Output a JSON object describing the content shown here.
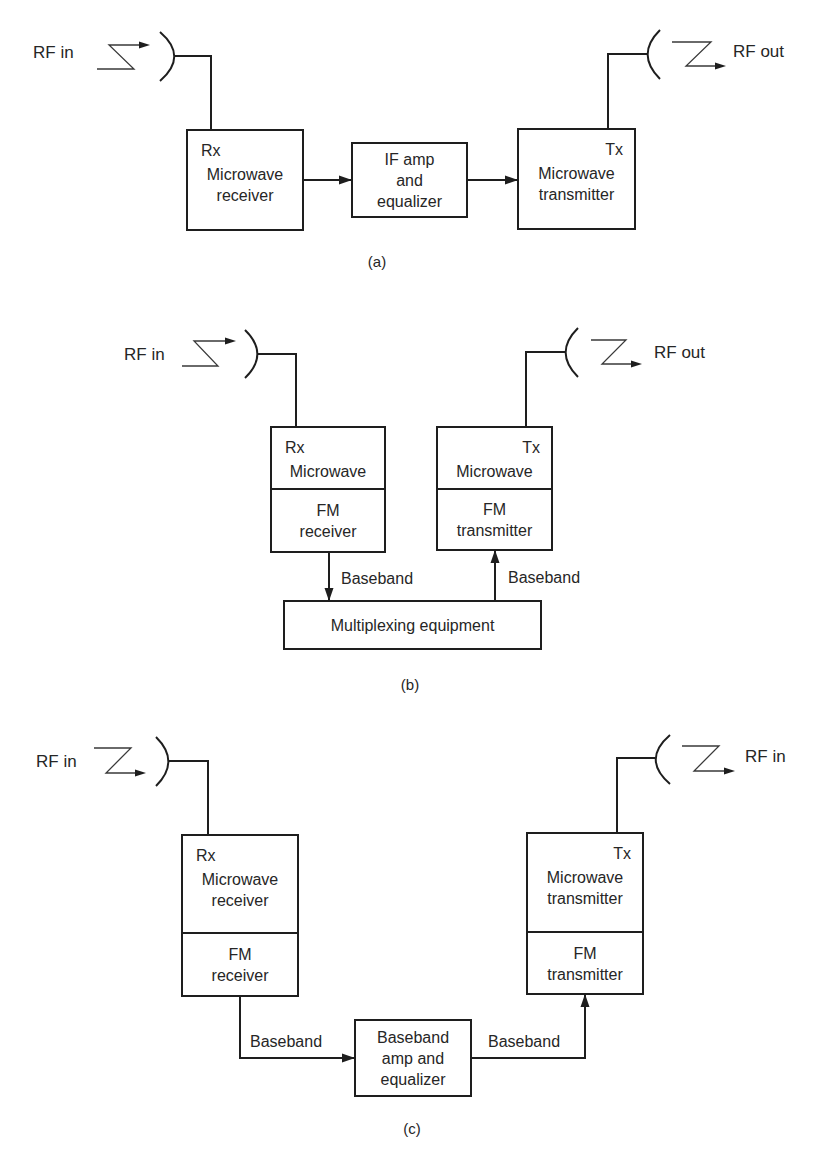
{
  "diagrams": [
    {
      "id": "a",
      "caption": "(a)",
      "caption_pos": [
        377,
        267
      ],
      "rf_left": {
        "label": "RF in",
        "label_pos": [
          33,
          58
        ],
        "zig": "rise",
        "zig_x": [
          97,
          109,
          134,
          150
        ],
        "zig_y": [
          45,
          69
        ],
        "arc": [
          160,
          32,
          175,
          81
        ],
        "feed": [
          [
            175,
            56
          ],
          [
            211,
            56
          ],
          [
            211,
            130
          ]
        ]
      },
      "rf_right": {
        "label": "RF out",
        "label_pos": [
          733,
          57
        ],
        "zig": "fall",
        "zig_x": [
          672,
          711,
          686,
          726
        ],
        "zig_y": [
          42,
          66
        ],
        "arc": [
          660,
          30,
          647,
          79
        ],
        "feed": [
          [
            608,
            129
          ],
          [
            608,
            54
          ],
          [
            647,
            54
          ]
        ]
      },
      "blocks": [
        {
          "name": "rx-microwave-receiver-block",
          "rect": [
            187,
            130,
            116,
            100
          ],
          "tag": "Rx",
          "tag_align": "left",
          "lines": [
            "Microwave",
            "receiver"
          ],
          "divider": null,
          "lower_lines": []
        },
        {
          "name": "if-amp-equalizer-block",
          "rect": [
            352,
            143,
            115,
            74
          ],
          "tag": "",
          "tag_align": "left",
          "lines": [
            "IF amp",
            "and",
            "equalizer"
          ],
          "divider": null,
          "lower_lines": []
        },
        {
          "name": "tx-microwave-transmitter-block",
          "rect": [
            518,
            129,
            117,
            100
          ],
          "tag": "Tx",
          "tag_align": "right",
          "lines": [
            "Microwave",
            "transmitter"
          ],
          "divider": null,
          "lower_lines": []
        }
      ],
      "connectors": [
        {
          "points": [
            [
              303,
              180
            ],
            [
              352,
              180
            ]
          ],
          "arrow": "end"
        },
        {
          "points": [
            [
              467,
              180
            ],
            [
              518,
              180
            ]
          ],
          "arrow": "end"
        }
      ],
      "labels": []
    },
    {
      "id": "b",
      "caption": "(b)",
      "caption_pos": [
        410,
        690
      ],
      "rf_left": {
        "label": "RF in",
        "label_pos": [
          124,
          360
        ],
        "zig": "rise",
        "zig_x": [
          182,
          194,
          218,
          236
        ],
        "zig_y": [
          341,
          366
        ],
        "arc": [
          245,
          330,
          258,
          378
        ],
        "feed": [
          [
            258,
            354
          ],
          [
            296,
            354
          ],
          [
            296,
            427
          ]
        ]
      },
      "rf_right": {
        "label": "RF out",
        "label_pos": [
          654,
          358
        ],
        "zig": "fall",
        "zig_x": [
          591,
          626,
          602,
          642
        ],
        "zig_y": [
          340,
          364
        ],
        "arc": [
          578,
          328,
          565,
          377
        ],
        "feed": [
          [
            526,
            427
          ],
          [
            526,
            352
          ],
          [
            565,
            352
          ]
        ]
      },
      "blocks": [
        {
          "name": "rx-microwave-fm-receiver-block",
          "rect": [
            271,
            427,
            114,
            125
          ],
          "tag": "Rx",
          "tag_align": "left",
          "lines": [
            "Microwave"
          ],
          "divider": 489,
          "lower_lines": [
            "FM",
            "receiver"
          ]
        },
        {
          "name": "tx-microwave-fm-transmitter-block",
          "rect": [
            437,
            427,
            115,
            123
          ],
          "tag": "Tx",
          "tag_align": "right",
          "lines": [
            "Microwave"
          ],
          "divider": 489,
          "lower_lines": [
            "FM",
            "transmitter"
          ]
        },
        {
          "name": "multiplexing-equipment-block",
          "rect": [
            284,
            601,
            257,
            48
          ],
          "tag": "",
          "tag_align": "left",
          "lines": [
            "Multiplexing equipment"
          ],
          "divider": null,
          "lower_lines": []
        }
      ],
      "connectors": [
        {
          "points": [
            [
              329,
              552
            ],
            [
              329,
              601
            ]
          ],
          "arrow": "end"
        },
        {
          "points": [
            [
              495,
              601
            ],
            [
              495,
              550
            ]
          ],
          "arrow": "end"
        }
      ],
      "labels": [
        {
          "text": "Baseband",
          "pos": [
            341,
            584
          ]
        },
        {
          "text": "Baseband",
          "pos": [
            508,
            583
          ]
        }
      ]
    },
    {
      "id": "c",
      "caption": "(c)",
      "caption_pos": [
        412,
        1134
      ],
      "rf_left": {
        "label": "RF in",
        "label_pos": [
          36,
          767
        ],
        "zig": "fall",
        "zig_x": [
          94,
          131,
          106,
          146
        ],
        "zig_y": [
          748,
          773
        ],
        "arc": [
          156,
          737,
          169,
          786
        ],
        "feed": [
          [
            169,
            761
          ],
          [
            208,
            761
          ],
          [
            208,
            835
          ]
        ]
      },
      "rf_right": {
        "label": "RF in",
        "label_pos": [
          745,
          762
        ],
        "zig": "fall",
        "zig_x": [
          682,
          719,
          694,
          735
        ],
        "zig_y": [
          746,
          771
        ],
        "arc": [
          670,
          735,
          655,
          784
        ],
        "feed": [
          [
            617,
            833
          ],
          [
            617,
            758
          ],
          [
            655,
            758
          ]
        ]
      },
      "blocks": [
        {
          "name": "rx-microwave-fm-receiver-block",
          "rect": [
            182,
            835,
            116,
            161
          ],
          "tag": "Rx",
          "tag_align": "left",
          "lines": [
            "Microwave",
            "receiver"
          ],
          "divider": 933,
          "lower_lines": [
            "FM",
            "receiver"
          ]
        },
        {
          "name": "baseband-amp-equalizer-block",
          "rect": [
            355,
            1020,
            116,
            76
          ],
          "tag": "",
          "tag_align": "left",
          "lines": [
            "Baseband",
            "amp and",
            "equalizer"
          ],
          "divider": null,
          "lower_lines": []
        },
        {
          "name": "tx-microwave-fm-transmitter-block",
          "rect": [
            527,
            833,
            116,
            161
          ],
          "tag": "Tx",
          "tag_align": "right",
          "lines": [
            "Microwave",
            "transmitter"
          ],
          "divider": 932,
          "lower_lines": [
            "FM",
            "transmitter"
          ]
        }
      ],
      "connectors": [
        {
          "points": [
            [
              240,
              996
            ],
            [
              240,
              1058
            ],
            [
              355,
              1058
            ]
          ],
          "arrow": "end"
        },
        {
          "points": [
            [
              471,
              1058
            ],
            [
              585,
              1058
            ],
            [
              585,
              994
            ]
          ],
          "arrow": "end"
        }
      ],
      "labels": [
        {
          "text": "Baseband",
          "pos": [
            250,
            1047
          ]
        },
        {
          "text": "Baseband",
          "pos": [
            488,
            1047
          ]
        }
      ]
    }
  ]
}
